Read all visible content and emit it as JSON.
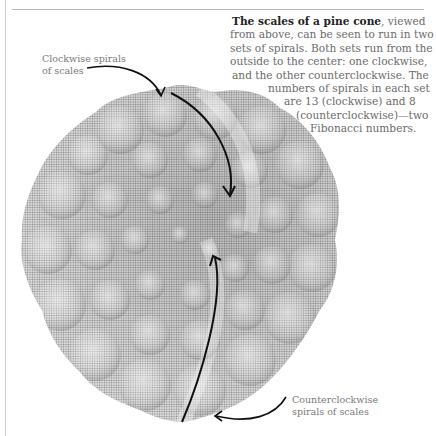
{
  "figure": {
    "main_caption": {
      "lead_bold": "The scales of a pine cone",
      "lines": [
        ", viewed",
        "from above, can be seen to run in two",
        "sets of spirals. Both sets run from the",
        "outside to the center: one clockwise,",
        "and the other counterclockwise. The",
        "numbers of spirals in each set",
        "are 13 (clockwise) and 8",
        "(counterclockwise)—two",
        "Fibonacci numbers."
      ]
    },
    "labels": {
      "clockwise": [
        "Clockwise spirals",
        "of scales"
      ],
      "counterclockwise": [
        "Counterclockwise",
        "spirals of scales"
      ]
    },
    "spiral_counts": {
      "clockwise": 13,
      "counterclockwise": 8
    },
    "colors": {
      "text": "#6b6b6b",
      "bold_text": "#222222",
      "arrow": "#111111",
      "cone_light": "#d9d9d9",
      "cone_dark": "#8f8f8f",
      "rule": "#b8b8b8"
    }
  }
}
